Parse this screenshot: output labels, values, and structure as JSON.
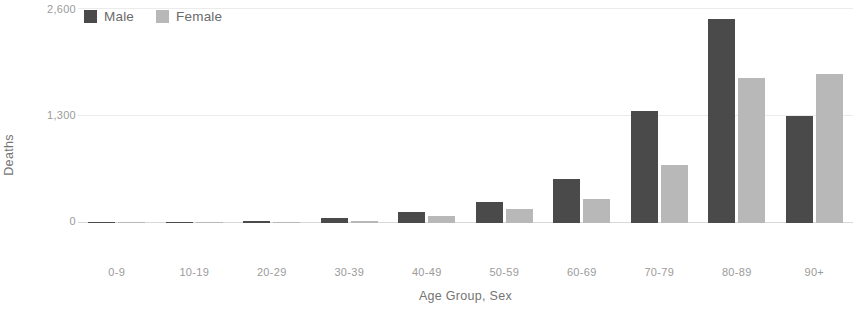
{
  "chart_data": {
    "type": "bar",
    "title": "",
    "subtitle": "",
    "xlabel": "Age Group, Sex",
    "ylabel": "Deaths",
    "categories": [
      "0-9",
      "10-19",
      "20-29",
      "30-39",
      "40-49",
      "50-59",
      "60-69",
      "70-79",
      "80-89",
      "90+"
    ],
    "series": [
      {
        "name": "Male",
        "color": "#4a4a4a",
        "values": [
          8,
          14,
          22,
          60,
          135,
          260,
          530,
          1360,
          2480,
          1300
        ]
      },
      {
        "name": "Female",
        "color": "#b8b8b8",
        "values": [
          6,
          10,
          14,
          30,
          80,
          165,
          290,
          700,
          1760,
          1810
        ]
      }
    ],
    "ylim": [
      0,
      2600
    ],
    "yticks": [
      0,
      1300,
      2600
    ],
    "ytick_labels": [
      "0",
      "1,300",
      "2,600"
    ],
    "grid": true,
    "legend_position": "top-left",
    "orientation": "vertical",
    "grouping": "grouped"
  },
  "legend": {
    "entries": [
      {
        "label": "Male",
        "color": "#4a4a4a"
      },
      {
        "label": "Female",
        "color": "#b8b8b8"
      }
    ]
  },
  "axes": {
    "y_title": "Deaths",
    "x_title": "Age Group, Sex",
    "y_tick_labels": [
      "2,600",
      "1,300",
      "0"
    ],
    "x_tick_labels": [
      "0-9",
      "10-19",
      "20-29",
      "30-39",
      "40-49",
      "50-59",
      "60-69",
      "70-79",
      "80-89",
      "90+"
    ]
  },
  "colors": {
    "male": "#4a4a4a",
    "female": "#b8b8b8",
    "gridline": "#ebebeb",
    "baseline": "#d8d8d8",
    "tick_text": "#9b9b9b",
    "axis_title_text": "#747474",
    "legend_text": "#6b6b6b",
    "background": "#ffffff"
  }
}
